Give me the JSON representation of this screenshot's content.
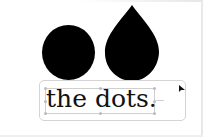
{
  "canvas": {
    "shapes": [
      {
        "type": "circle",
        "fill": "#000000"
      },
      {
        "type": "teardrop",
        "fill": "#000000"
      }
    ],
    "text_box": {
      "text": "the dots.",
      "selected": true,
      "border_color": "#d4d4d4",
      "selection_color": "#cfcfcf"
    },
    "cursor": "arrow-pointer"
  }
}
